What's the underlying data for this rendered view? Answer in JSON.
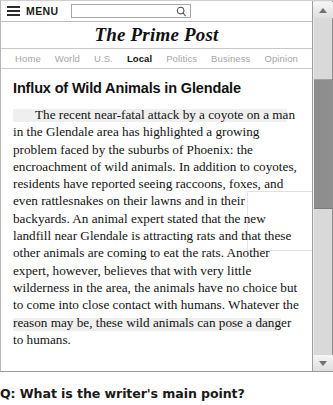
{
  "browser": {
    "menu": {
      "hamburger_icon": "hamburger-menu-icon",
      "label": "MENU"
    },
    "search": {
      "value": "",
      "placeholder": "",
      "icon": "search-icon"
    },
    "scrollbar": {
      "up_icon": "scroll-up-arrow-icon",
      "down_icon": "scroll-down-arrow-icon"
    }
  },
  "site": {
    "title": "The Prime Post"
  },
  "nav": {
    "items": [
      {
        "label": "Home",
        "active": false
      },
      {
        "label": "World",
        "active": false
      },
      {
        "label": "U.S.",
        "active": false
      },
      {
        "label": "Local",
        "active": true
      },
      {
        "label": "Politics",
        "active": false
      },
      {
        "label": "Business",
        "active": false
      },
      {
        "label": "Opinion",
        "active": false
      }
    ]
  },
  "article": {
    "headline": "Influx of Wild Animals in Glendale",
    "body": "The recent near-fatal attack by a coyote on a man in the Glendale area has highlighted a growing problem faced by the suburbs of Phoenix: the encroachment of wild animals. In addition to coyotes, residents have reported seeing raccoons, foxes, and even rattlesnakes on their lawns and in their backyards. An animal expert stated that the new landfill near Glendale is attracting rats and that these other animals are coming to eat the rats. Another expert, however, believes that with very little wilderness in the area, the animals have no choice but to come into close contact with humans. Whatever the reason may be, these wild animals can pose a danger to humans."
  },
  "question": {
    "text": "Q: What is the writer's main point?"
  },
  "colors": {
    "active_nav": "#111111",
    "inactive_nav": "#a5a5a5",
    "text": "#121212",
    "frame_border": "#b9b9b9",
    "scroll_thumb": "#8e8e8e"
  }
}
